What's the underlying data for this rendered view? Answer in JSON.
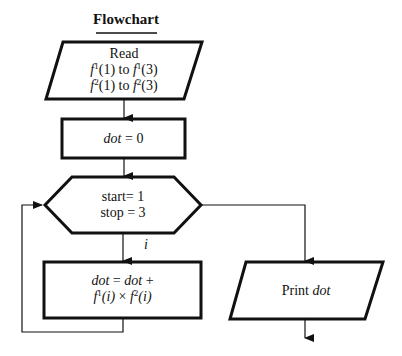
{
  "title": "Flowchart",
  "nodes": {
    "read": {
      "shape": "parallelogram",
      "line1": "Read",
      "line2": {
        "f": "f",
        "sup1": "1",
        "a1": "(1) to ",
        "f2": "f",
        "sup2": "1",
        "a2": "(3)"
      },
      "line3": {
        "f": "f",
        "sup1": "2",
        "a1": "(1) to ",
        "f2": "f",
        "sup2": "2",
        "a2": "(3)"
      }
    },
    "init": {
      "shape": "rectangle",
      "var": "dot",
      "rest": " = 0"
    },
    "loop": {
      "shape": "hexagon",
      "line1": "start= 1",
      "line2": "stop = 3",
      "index_label": "i"
    },
    "body": {
      "shape": "rectangle",
      "v1": "dot",
      "eq": " = ",
      "v2": "dot",
      "plus": " +",
      "f": "f",
      "sup1": "1",
      "arg1": "(i)",
      "times": " × ",
      "f2": "f",
      "sup2": "2",
      "arg2": "(i)"
    },
    "print": {
      "shape": "parallelogram",
      "label": "Print ",
      "var": "dot"
    }
  },
  "colors": {
    "stroke": "#111111",
    "background": "#ffffff"
  }
}
